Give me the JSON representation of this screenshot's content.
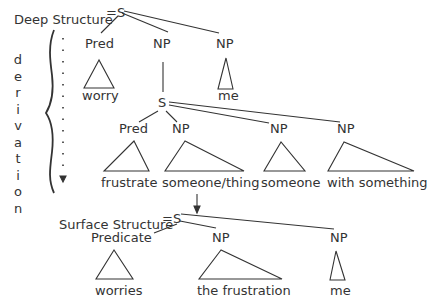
{
  "deep_structure": {
    "title": "Deep Structure",
    "eq": "=S",
    "children": [
      {
        "label": "Pred",
        "leaf": "worry"
      },
      {
        "label": "NP"
      },
      {
        "label": "NP",
        "leaf": "me"
      }
    ],
    "embedded": {
      "root": "S",
      "children": [
        {
          "label": "Pred",
          "leaf": "frustrate"
        },
        {
          "label": "NP",
          "leaf": "someone/thing"
        },
        {
          "label": "NP",
          "leaf": "someone"
        },
        {
          "label": "NP",
          "leaf": "with something"
        }
      ]
    }
  },
  "derivation": {
    "letters": [
      "d",
      "e",
      "r",
      "i",
      "v",
      "a",
      "t",
      "i",
      "o",
      "n"
    ]
  },
  "surface_structure": {
    "title": "Surface Structure",
    "eq": "=S",
    "children": [
      {
        "label": "Predicate",
        "leaf": "worries"
      },
      {
        "label": "NP",
        "leaf": "the frustration"
      },
      {
        "label": "NP",
        "leaf": "me"
      }
    ]
  },
  "colors": {
    "ink": "#333333",
    "background": "#ffffff"
  }
}
